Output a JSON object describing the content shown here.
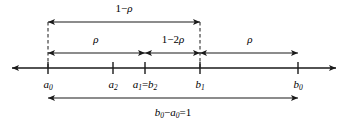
{
  "figure": {
    "type": "number-line-interval-diagram",
    "axis": {
      "y": 68,
      "x_start": 12,
      "x_end": 336,
      "arrow_left": true,
      "arrow_right": true
    },
    "ticks": [
      {
        "id": "a0",
        "x": 48,
        "label_html": "a<sub>0</sub>",
        "label_text": "a0"
      },
      {
        "id": "a2",
        "x": 113,
        "label_html": "a<sub>2</sub>",
        "label_text": "a2"
      },
      {
        "id": "a1b2",
        "x": 145,
        "label_html": "a<sub>1</sub><span class=\"upr\">=</span>b<sub>2</sub>",
        "label_text": "a1=b2"
      },
      {
        "id": "b1",
        "x": 200,
        "label_html": "b<sub>1</sub>",
        "label_text": "b1"
      },
      {
        "id": "b0",
        "x": 298,
        "label_html": "b<sub>0</sub>",
        "label_text": "b0"
      }
    ],
    "measures": [
      {
        "id": "top-one-minus-rho",
        "label_html": "<span class=\"upr\">1&#8722;</span>&rho;",
        "label_text": "1-rho",
        "from_x": 48,
        "to_x": 200,
        "y": 22,
        "label_x": 124,
        "label_y": 8,
        "arrows": "both"
      },
      {
        "id": "mid-rho-left",
        "label_html": "&rho;",
        "label_text": "rho",
        "from_x": 48,
        "to_x": 145,
        "y": 53,
        "label_x": 96,
        "label_y": 39,
        "arrows": "both"
      },
      {
        "id": "mid-one-minus-two-rho",
        "label_html": "<span class=\"upr\">1&#8722;2</span>&rho;",
        "label_text": "1-2rho",
        "from_x": 145,
        "to_x": 200,
        "y": 53,
        "label_x": 173,
        "label_y": 39,
        "arrows": "both"
      },
      {
        "id": "mid-rho-right",
        "label_html": "&rho;",
        "label_text": "rho",
        "from_x": 200,
        "to_x": 298,
        "y": 53,
        "label_x": 250,
        "label_y": 39,
        "arrows": "both"
      },
      {
        "id": "bottom-total-length",
        "label_html": "b<sub>0</sub><span class=\"upr\">&#8722;</span>a<sub>0</sub><span class=\"upr\">=1</span>",
        "label_text": "b0-a0=1",
        "from_x": 48,
        "to_x": 298,
        "y": 98,
        "label_x": 173,
        "label_y": 112,
        "arrows": "both"
      }
    ],
    "dashed_guides": [
      {
        "id": "guide-a0",
        "x": 48,
        "y_top": 22,
        "y_bottom": 70
      },
      {
        "id": "guide-b1",
        "x": 200,
        "y_top": 22,
        "y_bottom": 70
      }
    ],
    "colors": {
      "ink": "#1a1a1a",
      "background": "#ffffff"
    }
  }
}
